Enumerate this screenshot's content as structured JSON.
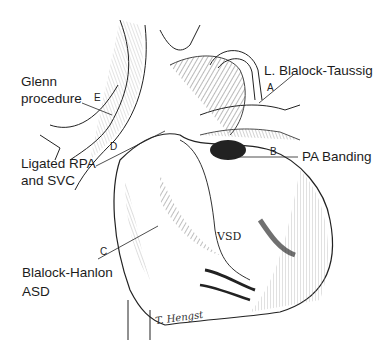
{
  "figure": {
    "type": "anatomical-illustration",
    "labels": [
      {
        "id": "glenn",
        "text_lines": [
          "Glenn",
          "procedure"
        ],
        "letter": "E"
      },
      {
        "id": "ligated-rpa",
        "text_lines": [
          "Ligated RPA",
          "and SVC"
        ],
        "letter": "D"
      },
      {
        "id": "blalock-hanlon",
        "text_lines": [
          "Blalock-Hanlon",
          "ASD"
        ],
        "letter": "C"
      },
      {
        "id": "l-blalock-taussig",
        "text_lines": [
          "L. Blalock-Taussig"
        ],
        "letter": "A"
      },
      {
        "id": "pa-banding",
        "text_lines": [
          "PA Banding"
        ],
        "letter": "B"
      }
    ],
    "inner_label": "VSD",
    "artist_signature": "T. Hengst",
    "caption_cut": true,
    "colors": {
      "ink": "#1a1a1a",
      "background": "#ffffff"
    }
  }
}
